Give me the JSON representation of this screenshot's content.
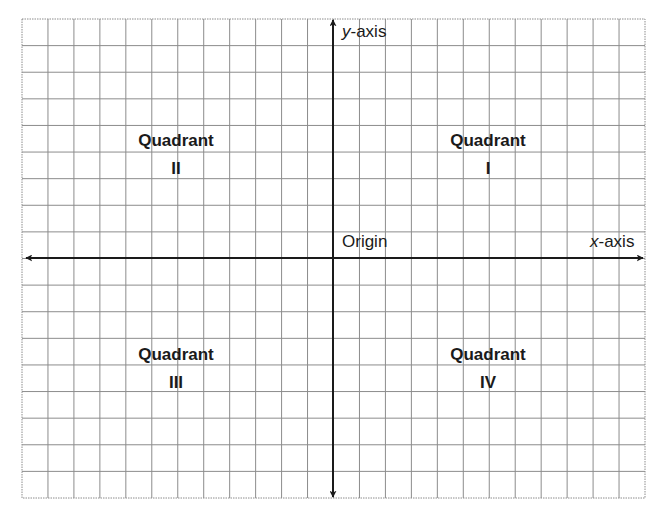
{
  "diagram": {
    "grid": {
      "columns": 24,
      "rows": 18,
      "left": 22,
      "top": 19,
      "right": 645,
      "bottom": 498,
      "line_color": "#8c8c8c"
    },
    "axes": {
      "x_axis": {
        "y": 258,
        "from": 26,
        "to": 643,
        "label_var": "x",
        "label_rest": "-axis"
      },
      "y_axis": {
        "x": 333,
        "from": 20,
        "to": 497,
        "label_var": "y",
        "label_rest": "-axis"
      },
      "color": "#1a1a1a"
    },
    "origin_label": "Origin",
    "quadrants": [
      {
        "word": "Quadrant",
        "numeral": "I"
      },
      {
        "word": "Quadrant",
        "numeral": "II"
      },
      {
        "word": "Quadrant",
        "numeral": "III"
      },
      {
        "word": "Quadrant",
        "numeral": "IV"
      }
    ]
  }
}
